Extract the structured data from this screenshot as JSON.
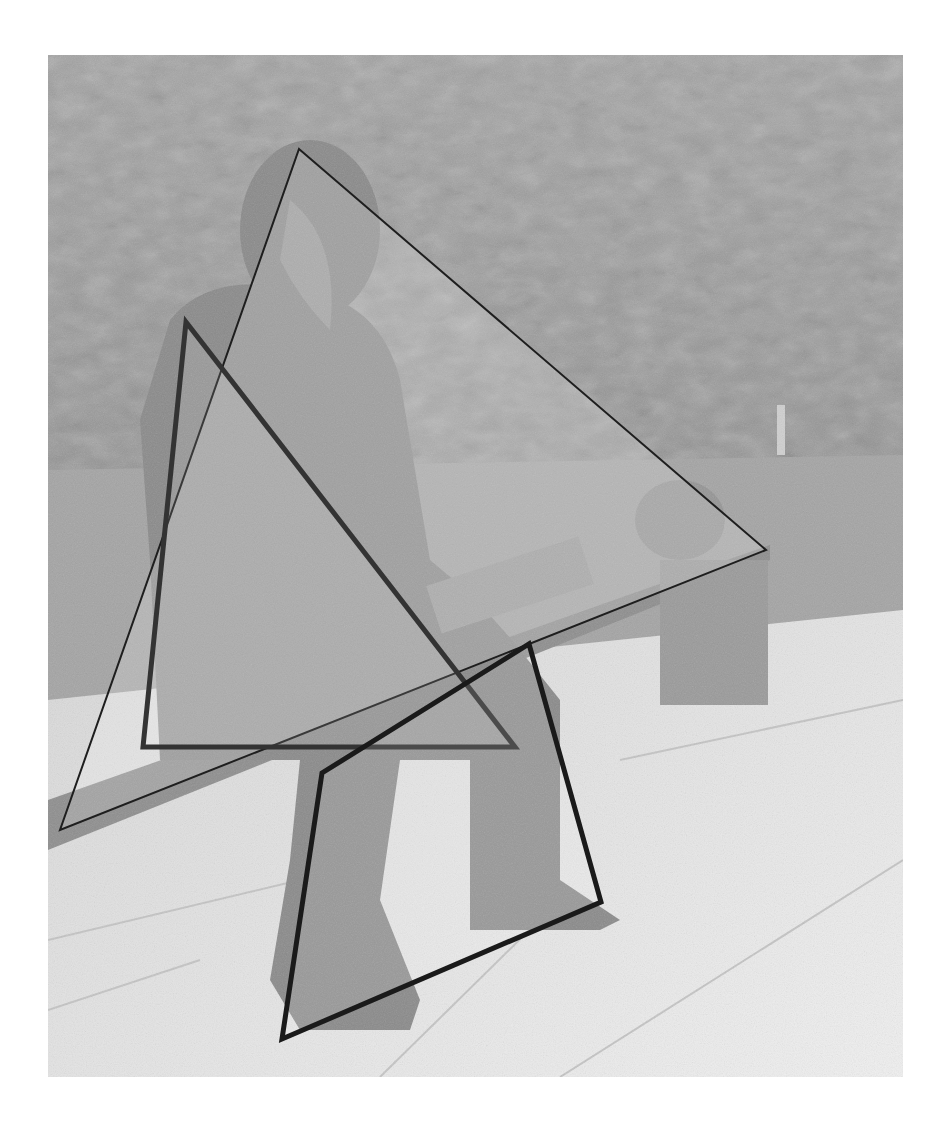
{
  "image": {
    "description": "Grayscale photo of a seated bronze statue on a bench with overlaid outlined polygons",
    "width": 950,
    "height": 1130,
    "photo_bounds": {
      "x": 48,
      "y": 55,
      "width": 855,
      "height": 1022
    }
  },
  "colors": {
    "sky_trees": "#9e9e9e",
    "trees_dark": "#8c8c8c",
    "lawn": "#a6a6a6",
    "pavement": "#e4e4e4",
    "statue": "#8a8a8a",
    "bench": "#9a9a9a",
    "overlay_fill": "rgba(255,255,255,0.18)"
  },
  "overlays": [
    {
      "name": "large-triangle",
      "type": "triangle",
      "points": [
        [
          299,
          149
        ],
        [
          766,
          550
        ],
        [
          60,
          830
        ]
      ],
      "stroke": "#1e1e1e",
      "stroke_width": 2
    },
    {
      "name": "inner-triangle",
      "type": "triangle",
      "points": [
        [
          186,
          322
        ],
        [
          515,
          747
        ],
        [
          143,
          747
        ]
      ],
      "stroke": "#333333",
      "stroke_width": 5
    },
    {
      "name": "quadrilateral",
      "type": "quadrilateral",
      "points": [
        [
          529,
          644
        ],
        [
          601,
          902
        ],
        [
          282,
          1039
        ],
        [
          322,
          773
        ]
      ],
      "stroke": "#1a1a1a",
      "stroke_width": 5
    }
  ],
  "caption": {
    "text": ""
  }
}
